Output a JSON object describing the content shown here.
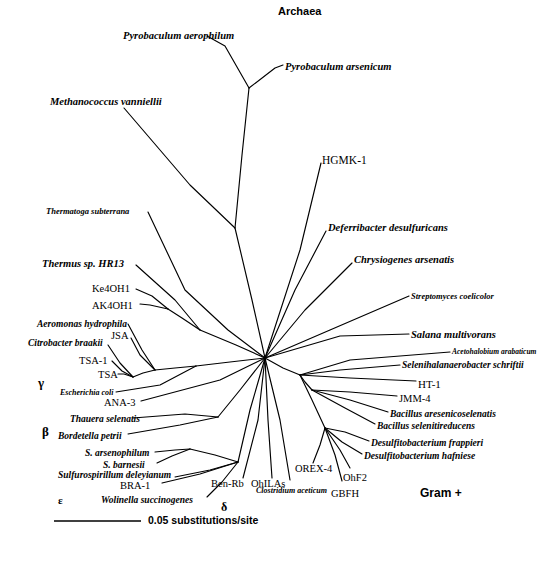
{
  "figure": {
    "type": "unrooted-phylogenetic-tree",
    "title_top": "Archaea",
    "scale_bar": {
      "label": "0.05 substitutions/site",
      "length_px": 66
    }
  },
  "group_labels": [
    {
      "id": "archaea",
      "text": "Archaea",
      "x": 278,
      "y": 6,
      "style": "grp",
      "size": 11
    },
    {
      "id": "gram-plus",
      "text": "Gram +",
      "x": 420,
      "y": 487,
      "style": "grp",
      "size": 12
    },
    {
      "id": "gamma",
      "text": "γ",
      "x": 38,
      "y": 376,
      "style": "grk",
      "size": 13
    },
    {
      "id": "beta",
      "text": "β",
      "x": 42,
      "y": 425,
      "style": "grk",
      "size": 13
    },
    {
      "id": "epsilon",
      "text": "ε",
      "x": 58,
      "y": 495,
      "style": "grk",
      "size": 11
    },
    {
      "id": "delta",
      "text": "δ",
      "x": 221,
      "y": 501,
      "style": "grk",
      "size": 12
    }
  ],
  "taxa": [
    {
      "id": "pyrobaculum-aerophilum",
      "text": "Pyrobaculum aerophilum",
      "x": 123,
      "y": 31,
      "style": "sci",
      "size": 10.5,
      "anchor": "start"
    },
    {
      "id": "pyrobaculum-arsenicum",
      "text": "Pyrobaculum arsenicum",
      "x": 285,
      "y": 62,
      "style": "sci",
      "size": 10.5,
      "anchor": "start"
    },
    {
      "id": "methanococcus-vanniellii",
      "text": "Methanococcus vanniellii",
      "x": 50,
      "y": 97,
      "style": "sci",
      "size": 10.5,
      "anchor": "start"
    },
    {
      "id": "hgmk-1",
      "text": "HGMK-1",
      "x": 322,
      "y": 155,
      "style": "pln",
      "size": 11.5,
      "anchor": "start"
    },
    {
      "id": "thermatoga-subterrana",
      "text": "Thermatoga subterrana",
      "x": 46,
      "y": 207,
      "style": "sci",
      "size": 8.5,
      "anchor": "start"
    },
    {
      "id": "deferribacter-desulfuricans",
      "text": "Deferribacter desulfuricans",
      "x": 328,
      "y": 223,
      "style": "sci",
      "size": 10.5,
      "anchor": "start"
    },
    {
      "id": "chrysiogenes-arsenatis",
      "text": "Chrysiogenes arsenatis",
      "x": 354,
      "y": 255,
      "style": "sci",
      "size": 10.5,
      "anchor": "start"
    },
    {
      "id": "thermus-sp-hr13",
      "text": "Thermus sp. HR13",
      "x": 42,
      "y": 259,
      "style": "sci",
      "size": 10.5,
      "anchor": "start"
    },
    {
      "id": "ke4oh1",
      "text": "Ke4OH1",
      "x": 92,
      "y": 284,
      "style": "pln",
      "size": 10.5,
      "anchor": "start"
    },
    {
      "id": "streptomyces-coelicolor",
      "text": "Streptomyces coelicolor",
      "x": 411,
      "y": 292,
      "style": "sci",
      "size": 8.5,
      "anchor": "start"
    },
    {
      "id": "ak4oh1",
      "text": "AK4OH1",
      "x": 92,
      "y": 301,
      "style": "pln",
      "size": 10.5,
      "anchor": "start"
    },
    {
      "id": "aeromonas-hydrophila",
      "text": "Aeromonas hydrophila",
      "x": 37,
      "y": 320,
      "style": "sci",
      "size": 9.5,
      "anchor": "start"
    },
    {
      "id": "salana-multivorans",
      "text": "Salana multivorans",
      "x": 411,
      "y": 330,
      "style": "sci",
      "size": 10.5,
      "anchor": "start"
    },
    {
      "id": "jsa",
      "text": "JSA",
      "x": 111,
      "y": 331,
      "style": "pln",
      "size": 10.5,
      "anchor": "start"
    },
    {
      "id": "citrobacter-braakii",
      "text": "Citrobacter braakii",
      "x": 28,
      "y": 339,
      "style": "sci",
      "size": 9.5,
      "anchor": "start"
    },
    {
      "id": "acetohalobium-arabaticum",
      "text": "Acetohalobium arabaticum",
      "x": 452,
      "y": 348,
      "style": "sci",
      "size": 7.5,
      "anchor": "start"
    },
    {
      "id": "tsa-1",
      "text": "TSA-1",
      "x": 79,
      "y": 356,
      "style": "pln",
      "size": 10.5,
      "anchor": "start"
    },
    {
      "id": "selenihalanaerobacter-schriftii",
      "text": "Selenihalanaerobacter schriftii",
      "x": 402,
      "y": 361,
      "style": "sci",
      "size": 9.5,
      "anchor": "start"
    },
    {
      "id": "tsa",
      "text": "TSA",
      "x": 98,
      "y": 370,
      "style": "pln",
      "size": 10.5,
      "anchor": "start"
    },
    {
      "id": "ht-1",
      "text": "HT-1",
      "x": 418,
      "y": 379,
      "style": "pln",
      "size": 11,
      "anchor": "start"
    },
    {
      "id": "escherichia-coli",
      "text": "Escherichia coli",
      "x": 60,
      "y": 389,
      "style": "sci",
      "size": 8,
      "anchor": "start"
    },
    {
      "id": "jmm-4",
      "text": "JMM-4",
      "x": 399,
      "y": 394,
      "style": "pln",
      "size": 10.5,
      "anchor": "start"
    },
    {
      "id": "ana-3",
      "text": "ANA-3",
      "x": 104,
      "y": 398,
      "style": "pln",
      "size": 10.5,
      "anchor": "start"
    },
    {
      "id": "bacillus-aresenicoselenatis",
      "text": "Bacillus aresenicoselenatis",
      "x": 390,
      "y": 410,
      "style": "sci",
      "size": 9.5,
      "anchor": "start"
    },
    {
      "id": "thauera-selenatis",
      "text": "Thauera selenatis",
      "x": 70,
      "y": 415,
      "style": "sci",
      "size": 9.5,
      "anchor": "start"
    },
    {
      "id": "bacillus-selenitireducens",
      "text": "Bacillus selenitireducens",
      "x": 377,
      "y": 422,
      "style": "sci",
      "size": 9.5,
      "anchor": "start"
    },
    {
      "id": "bordetella-petrii",
      "text": "Bordetella petrii",
      "x": 58,
      "y": 432,
      "style": "sci",
      "size": 9.5,
      "anchor": "start"
    },
    {
      "id": "desulfitobacterium-frappieri",
      "text": "Desulfitobacterium frappieri",
      "x": 371,
      "y": 439,
      "style": "sci",
      "size": 9.5,
      "anchor": "start"
    },
    {
      "id": "s-arsenophilum",
      "text": "S. arsenophilum",
      "x": 85,
      "y": 449,
      "style": "sci",
      "size": 9.5,
      "anchor": "start"
    },
    {
      "id": "desulfitobacterium-hafniese",
      "text": "Desulfitobacterium hafniese",
      "x": 364,
      "y": 452,
      "style": "sci",
      "size": 9.5,
      "anchor": "start"
    },
    {
      "id": "s-barnesii",
      "text": "S. barnesii",
      "x": 103,
      "y": 461,
      "style": "sci",
      "size": 9.5,
      "anchor": "start"
    },
    {
      "id": "sulfurospirillum-deleyianum",
      "text": "Sulfurospirillum deleyianum",
      "x": 58,
      "y": 471,
      "style": "sci",
      "size": 9.5,
      "anchor": "start"
    },
    {
      "id": "orex-4",
      "text": "OREX-4",
      "x": 295,
      "y": 464,
      "style": "pln",
      "size": 10.5,
      "anchor": "start"
    },
    {
      "id": "ohf2",
      "text": "OhF2",
      "x": 343,
      "y": 473,
      "style": "pln",
      "size": 10.5,
      "anchor": "start"
    },
    {
      "id": "bra-1",
      "text": "BRA-1",
      "x": 120,
      "y": 481,
      "style": "pln",
      "size": 10.5,
      "anchor": "start"
    },
    {
      "id": "ben-rb",
      "text": "Ben-Rb",
      "x": 211,
      "y": 479,
      "style": "pln",
      "size": 10.5,
      "anchor": "start"
    },
    {
      "id": "ohilas",
      "text": "OhILAs",
      "x": 251,
      "y": 479,
      "style": "pln",
      "size": 10.5,
      "anchor": "start"
    },
    {
      "id": "clostridium-aceticum",
      "text": "Clostridium aceticum",
      "x": 256,
      "y": 487,
      "style": "sci",
      "size": 8,
      "anchor": "start"
    },
    {
      "id": "gbfh",
      "text": "GBFH",
      "x": 331,
      "y": 489,
      "style": "pln",
      "size": 10.5,
      "anchor": "start"
    },
    {
      "id": "wolinella-succinogenes",
      "text": "Wolinella succinogenes",
      "x": 101,
      "y": 496,
      "style": "sci",
      "size": 9.5,
      "anchor": "start"
    }
  ],
  "scale": {
    "text": "0.05 substitutions/site",
    "text_x": 148,
    "text_y": 515,
    "line_x1": 54,
    "line_x2": 141,
    "line_y": 521
  },
  "branches": [
    {
      "id": "b-pyro-aero",
      "points": "249,88 225,46 207,36"
    },
    {
      "id": "b-pyro-arse",
      "points": "249,88 275,68 283,65"
    },
    {
      "id": "b-pyro-stem",
      "points": "249,88 242,155 235,228"
    },
    {
      "id": "b-methano",
      "points": "235,228 190,185 124,108"
    },
    {
      "id": "b-arch-stem",
      "points": "235,228 252,300 265,358"
    },
    {
      "id": "b-hgmk",
      "points": "265,358 300,250 321,163"
    },
    {
      "id": "b-deferri",
      "points": "265,358 295,290 326,231"
    },
    {
      "id": "b-chrysio",
      "points": "265,358 305,310 352,263"
    },
    {
      "id": "b-thermatoga",
      "points": "265,358 228,330 185,290 148,212"
    },
    {
      "id": "b-thermus-node",
      "points": "265,358 236,345 200,330"
    },
    {
      "id": "b-thermus",
      "points": "200,330 175,300 136,265"
    },
    {
      "id": "b-ke4oh1-node",
      "points": "200,330 182,318 168,309"
    },
    {
      "id": "b-ke4oh1",
      "points": "168,309 152,296 136,289"
    },
    {
      "id": "b-ak4oh1",
      "points": "168,309 150,305 140,304"
    },
    {
      "id": "b-gamma-stem",
      "points": "265,358 230,362 196,366"
    },
    {
      "id": "b-gamma-node",
      "points": "196,366 175,368 155,370"
    },
    {
      "id": "b-aeromonas",
      "points": "155,370 142,350 128,324"
    },
    {
      "id": "b-jsa",
      "points": "155,370 140,355 131,338"
    },
    {
      "id": "b-gamma2",
      "points": "155,370 143,373 133,377"
    },
    {
      "id": "b-citrobacter",
      "points": "133,377 120,363 108,345"
    },
    {
      "id": "b-tsa1",
      "points": "133,377 122,371 112,361"
    },
    {
      "id": "b-tsa",
      "points": "133,377 124,374 118,374"
    },
    {
      "id": "b-ecoli",
      "points": "196,366 160,385 116,392"
    },
    {
      "id": "b-ana3",
      "points": "265,358 220,380 141,401"
    },
    {
      "id": "b-beta-stem",
      "points": "265,358 240,390 218,417"
    },
    {
      "id": "b-thauera",
      "points": "218,417 185,414 133,418"
    },
    {
      "id": "b-bordetella",
      "points": "218,417 180,425 128,434"
    },
    {
      "id": "b-eps-stem",
      "points": "265,358 250,410 238,462"
    },
    {
      "id": "b-eps-node",
      "points": "238,462 215,455 190,449"
    },
    {
      "id": "b-s-arseno",
      "points": "190,449 175,450 155,452"
    },
    {
      "id": "b-s-barnesii",
      "points": "190,449 172,456 157,463"
    },
    {
      "id": "b-sulfuro",
      "points": "238,462 210,470 175,477"
    },
    {
      "id": "b-bra1",
      "points": "238,462 200,474 162,483"
    },
    {
      "id": "b-wolinella",
      "points": "238,462 222,482 207,497"
    },
    {
      "id": "b-benrb",
      "points": "265,358 258,420 243,478"
    },
    {
      "id": "b-delta2",
      "points": "265,358 268,420 272,478"
    },
    {
      "id": "b-clostridium",
      "points": "265,358 280,420 290,480"
    },
    {
      "id": "b-strepto",
      "points": "265,358 330,330 409,296"
    },
    {
      "id": "b-salana",
      "points": "265,358 340,336 409,334"
    },
    {
      "id": "b-gram-stem",
      "points": "265,358 283,368 300,375"
    },
    {
      "id": "b-aceto",
      "points": "300,375 350,360 450,352"
    },
    {
      "id": "b-selenihal",
      "points": "300,375 340,370 400,365"
    },
    {
      "id": "b-ht1",
      "points": "300,375 350,378 416,381"
    },
    {
      "id": "b-gram2",
      "points": "300,375 305,382 312,390"
    },
    {
      "id": "b-jmm4",
      "points": "312,390 350,392 397,396"
    },
    {
      "id": "b-bac-arse",
      "points": "312,390 350,400 388,412"
    },
    {
      "id": "b-bac-sel",
      "points": "312,390 345,408 375,424"
    },
    {
      "id": "b-gram3",
      "points": "300,375 312,400 325,428"
    },
    {
      "id": "b-desulf-frap",
      "points": "325,428 345,432 369,441"
    },
    {
      "id": "b-desulf-haf",
      "points": "325,428 342,442 362,454"
    },
    {
      "id": "b-orex4",
      "points": "325,428 320,445 313,463"
    },
    {
      "id": "b-ohf2",
      "points": "325,428 340,450 350,468"
    },
    {
      "id": "b-gbfh",
      "points": "325,428 335,455 342,481"
    }
  ]
}
